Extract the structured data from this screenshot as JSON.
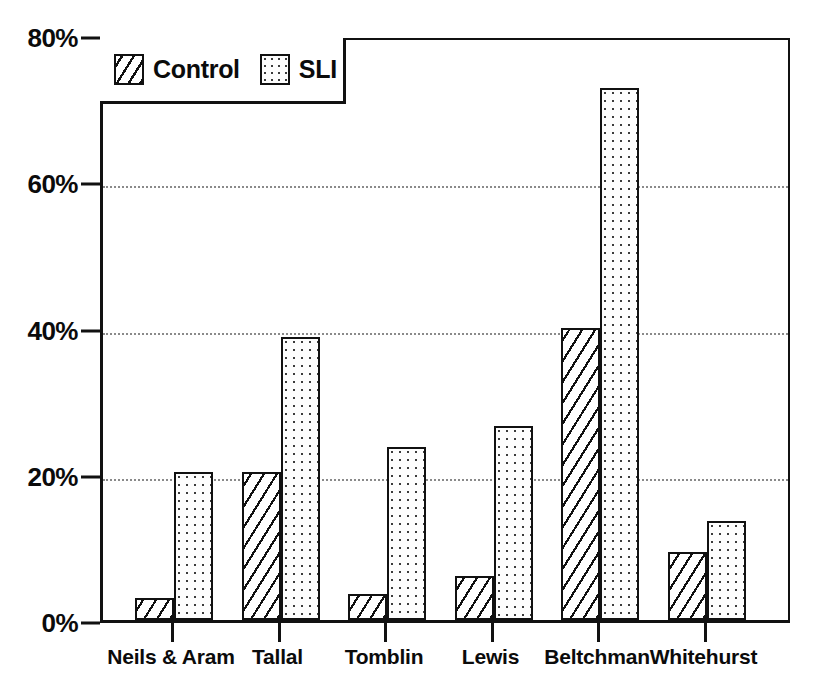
{
  "chart_data": {
    "type": "bar",
    "title": "",
    "subtitle": "",
    "xlabel": "",
    "ylabel": "",
    "categories": [
      "Neils & Aram",
      "Tallal",
      "Tomblin",
      "Lewis",
      "Beltchman",
      "Whitehurst"
    ],
    "series": [
      {
        "name": "Control",
        "pattern": "diagonal-hatch",
        "values": [
          3.0,
          20.2,
          3.6,
          6.0,
          40.0,
          9.3
        ]
      },
      {
        "name": "SLI",
        "pattern": "dotted-stipple",
        "values": [
          20.2,
          38.7,
          23.7,
          26.5,
          72.7,
          13.5
        ]
      }
    ],
    "ylim": [
      0,
      80
    ],
    "y_ticks": [
      0,
      20,
      40,
      60,
      80
    ],
    "y_tick_labels": [
      "0%",
      "20%",
      "40%",
      "60%",
      "80%"
    ],
    "grid": true,
    "grid_axis": "y",
    "grid_style": "dotted",
    "legend_position": "top-left",
    "legend_entries": [
      "Control",
      "SLI"
    ],
    "value_unit": "%"
  },
  "legend": {
    "items": [
      {
        "label": "Control",
        "swatch": "control"
      },
      {
        "label": "SLI",
        "swatch": "sli"
      }
    ]
  },
  "colors": {
    "ink": "#111111",
    "grid": "#8a8a8a",
    "background": "#ffffff"
  }
}
